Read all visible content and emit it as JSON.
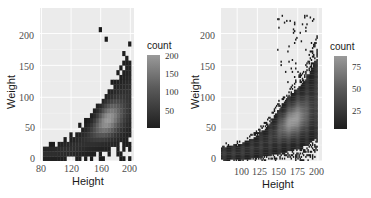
{
  "chart_data": [
    {
      "type": "heatmap",
      "title": "",
      "xlabel": "Height",
      "ylabel": "Weight",
      "x_ticks": [
        "80",
        "120",
        "160",
        "200"
      ],
      "y_ticks": [
        "0",
        "50",
        "100",
        "150",
        "200"
      ],
      "xlim": [
        78,
        205
      ],
      "ylim": [
        0,
        240
      ],
      "grid": true,
      "legend": {
        "title": "count",
        "position": "right",
        "ticks": [
          "200",
          "150",
          "100",
          "50"
        ],
        "range": [
          1,
          210
        ]
      },
      "bins": "coarse (~30 bins)",
      "description": "2D histogram of Height vs Weight; density peaks near Height 165, Weight 70"
    },
    {
      "type": "heatmap",
      "title": "",
      "xlabel": "Height",
      "ylabel": "Weight",
      "x_ticks": [
        "100",
        "125",
        "150",
        "175",
        "200"
      ],
      "y_ticks": [
        "0",
        "50",
        "100",
        "150",
        "200"
      ],
      "xlim": [
        80,
        205
      ],
      "ylim": [
        0,
        240
      ],
      "grid": true,
      "legend": {
        "title": "count",
        "position": "right",
        "ticks": [
          "75",
          "50",
          "25"
        ],
        "range": [
          1,
          95
        ]
      },
      "bins": "fine (~100 bins)",
      "description": "2D histogram of Height vs Weight; density peaks near Height 168, Weight 70"
    }
  ],
  "left": {
    "xlabel": "Height",
    "ylabel": "Weight",
    "x_ticks": [
      "80",
      "120",
      "160",
      "200"
    ],
    "y_ticks": [
      "200",
      "150",
      "100",
      "50",
      "0"
    ],
    "legend_title": "count",
    "legend_ticks": [
      "200",
      "150",
      "100",
      "50"
    ]
  },
  "right": {
    "xlabel": "Height",
    "ylabel": "Weight",
    "x_ticks": [
      "100",
      "125",
      "150",
      "175",
      "200"
    ],
    "y_ticks": [
      "200",
      "150",
      "100",
      "50",
      "0"
    ],
    "legend_title": "count",
    "legend_ticks": [
      "75",
      "50",
      "25"
    ]
  },
  "colors": {
    "panel_bg": "#ebebeb",
    "grid": "#ffffff",
    "low": "#1a1a1a",
    "high": "#9a9a9a"
  }
}
